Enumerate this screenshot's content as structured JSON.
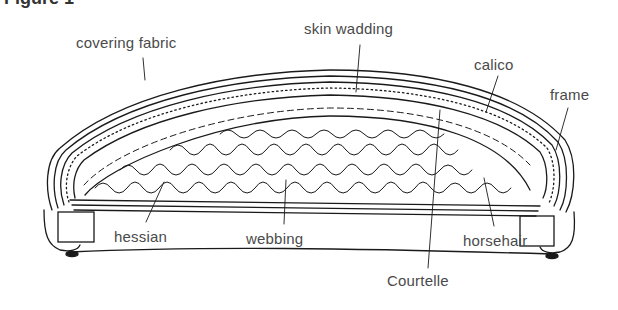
{
  "figure": {
    "title": "Figure 1"
  },
  "labels": {
    "covering_fabric": "covering fabric",
    "skin_wadding": "skin wadding",
    "calico": "calico",
    "frame": "frame",
    "hessian": "hessian",
    "webbing": "webbing",
    "horsehair": "horsehair",
    "courtelle": "Courtelle"
  },
  "colors": {
    "ink": "#1a1a1a",
    "label_text": "#4a4a4a",
    "background": "#ffffff"
  }
}
